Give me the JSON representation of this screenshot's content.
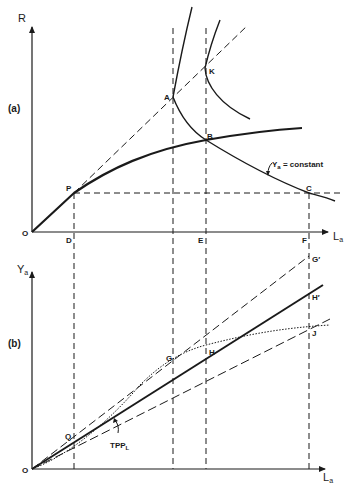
{
  "figure": {
    "panel_a": {
      "panel_label": "(a)",
      "y_axis_label": "R",
      "x_axis_label": "L",
      "x_axis_subscript": "a",
      "origin_label": "O",
      "points": {
        "P": "P",
        "A": "A",
        "K": "K",
        "B": "B",
        "C": "C",
        "D": "D",
        "E": "E",
        "F": "F"
      },
      "curve_annotation": "Y",
      "curve_annotation_subscript": "a",
      "curve_annotation_rest": " = constant"
    },
    "panel_b": {
      "panel_label": "(b)",
      "y_axis_label": "Y",
      "y_axis_subscript": "a",
      "x_axis_label": "L",
      "x_axis_subscript": "a",
      "origin_label": "O",
      "points": {
        "Q": "Q",
        "G": "G",
        "H": "H",
        "G_prime": "G′",
        "H_prime": "H′",
        "J": "J"
      },
      "curve_annotation": "TPP",
      "curve_annotation_subscript": "L"
    },
    "colors": {
      "ink": "#1a1a1a",
      "background": "#ffffff"
    }
  }
}
